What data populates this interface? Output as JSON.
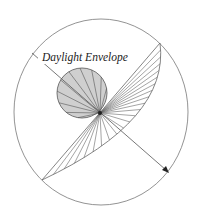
{
  "diagram": {
    "label": "Daylight Envelope",
    "colors": {
      "line": "#555555",
      "shade": "#cfcfcf",
      "background": "#ffffff"
    },
    "outer_boundary": {
      "cx": 101,
      "cy": 112,
      "rx": 87,
      "ry": 93
    },
    "origin": {
      "x": 100,
      "y": 113
    },
    "envelope_circle": {
      "cx": 82,
      "cy": 93,
      "r": 25
    },
    "wedge": {
      "start": [
        160,
        43
      ],
      "end": [
        42,
        180
      ]
    },
    "arrow": {
      "from": [
        32,
        53
      ],
      "to": [
        168,
        172
      ]
    }
  }
}
